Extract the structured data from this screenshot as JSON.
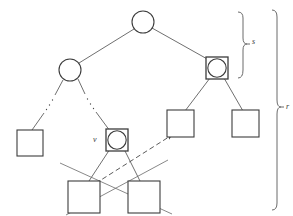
{
  "figure": {
    "kind": "tree-diagram",
    "width": 293,
    "height": 216,
    "background_color": "#ffffff",
    "stroke_color": "#4a4a4a",
    "node_fill": "#ffffff",
    "labels": {
      "node_v": "v",
      "brace_top": "s",
      "brace_full": "r"
    }
  },
  "nodes": [
    {
      "id": "root",
      "shape": "circle",
      "cx": 143,
      "cy": 22,
      "r": 11
    },
    {
      "id": "left-inner",
      "shape": "circle",
      "cx": 70,
      "cy": 70,
      "r": 11
    },
    {
      "id": "right-inner",
      "shape": "circle-in-square",
      "cx": 217,
      "cy": 68,
      "r": 9,
      "size": 22
    },
    {
      "id": "leaf-far-left",
      "shape": "square",
      "cx": 30,
      "cy": 143,
      "size": 26
    },
    {
      "id": "node-v",
      "shape": "circle-in-square",
      "cx": 117,
      "cy": 140,
      "r": 9,
      "size": 22
    },
    {
      "id": "leaf-mid-right",
      "shape": "square",
      "cx": 181,
      "cy": 124,
      "size": 27
    },
    {
      "id": "leaf-right",
      "shape": "square",
      "cx": 246,
      "cy": 124,
      "size": 27
    },
    {
      "id": "leaf-bottom-left",
      "shape": "square",
      "cx": 84,
      "cy": 197,
      "size": 32
    },
    {
      "id": "leaf-bottom-right",
      "shape": "square",
      "cx": 144,
      "cy": 197,
      "size": 32
    }
  ],
  "edges": [
    {
      "from": "root",
      "to": "left-inner",
      "style": "solid"
    },
    {
      "from": "root",
      "to": "right-inner",
      "style": "solid"
    },
    {
      "from": "left-inner",
      "to": "leaf-far-left",
      "style": "dotted-gap"
    },
    {
      "from": "left-inner",
      "to": "node-v",
      "style": "dotted-gap"
    },
    {
      "from": "right-inner",
      "to": "leaf-mid-right",
      "style": "solid"
    },
    {
      "from": "right-inner",
      "to": "leaf-right",
      "style": "solid"
    },
    {
      "from": "node-v",
      "to": "leaf-bottom-left",
      "style": "solid"
    },
    {
      "from": "node-v",
      "to": "leaf-bottom-right",
      "style": "solid"
    }
  ],
  "crossing_lines": [
    {
      "x1": 60,
      "y1": 163,
      "x2": 172,
      "y2": 214
    },
    {
      "x1": 168,
      "y1": 160,
      "x2": 66,
      "y2": 215
    }
  ],
  "arrow": {
    "x1": 82,
    "y1": 192,
    "x2": 174,
    "y2": 134,
    "style": "dashed",
    "head": "filled-triangle"
  },
  "braces": [
    {
      "id": "brace-top",
      "x": 243,
      "y_top": 12,
      "y_bottom": 78,
      "label": "s",
      "label_x": 252,
      "label_y": 41
    },
    {
      "id": "brace-full",
      "x": 277,
      "y_top": 10,
      "y_bottom": 210,
      "label": "r",
      "label_x": 286,
      "label_y": 107
    }
  ]
}
